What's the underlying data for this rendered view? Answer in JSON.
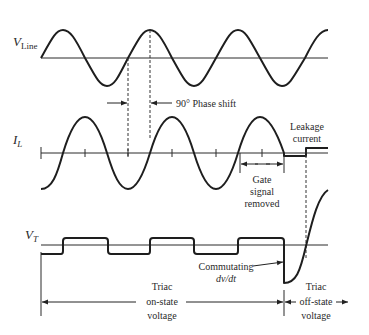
{
  "figure": {
    "type": "triac commutation timing diagram",
    "traces": [
      {
        "id": "v_line",
        "label_main": "V",
        "label_sub": "Line",
        "description": "Line voltage sine wave"
      },
      {
        "id": "i_l",
        "label_main": "I",
        "label_sub": "L",
        "description": "Load current sine wave lagging line voltage by 90 degrees, then leakage current"
      },
      {
        "id": "v_t",
        "label_main": "V",
        "label_sub": "T",
        "description": "Triac voltage: small square wave on-state, then commutating spike to off-state"
      }
    ],
    "annotations": {
      "phase_shift": "90° Phase shift",
      "leakage_line1": "Leakage",
      "leakage_line2": "current",
      "gate_line1": "Gate",
      "gate_line2": "signal",
      "gate_line3": "removed",
      "commutating_line1": "Commutating",
      "commutating_line2": "dv/dt",
      "on_state_line1": "Triac",
      "on_state_line2": "on-state",
      "on_state_line3": "voltage",
      "off_state_line1": "Triac",
      "off_state_line2": "off-state",
      "off_state_line3": "voltage"
    }
  }
}
